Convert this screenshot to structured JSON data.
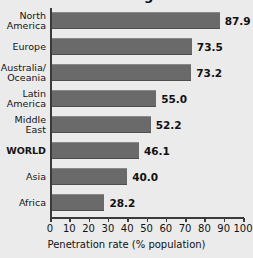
{
  "chart_data": {
    "type": "bar",
    "orientation": "horizontal",
    "title": "World Region",
    "xlabel": "Penetration rate (% population)",
    "ylabel": "",
    "categories": [
      "North America",
      "Europe",
      "Australia/ Oceania",
      "Latin America",
      "Middle East",
      "WORLD",
      "Asia",
      "Africa"
    ],
    "category_lines": [
      [
        "North",
        "America"
      ],
      [
        "Europe"
      ],
      [
        "Australia/",
        "Oceania"
      ],
      [
        "Latin",
        "America"
      ],
      [
        "Middle",
        "East"
      ],
      [
        "WORLD"
      ],
      [
        "Asia"
      ],
      [
        "Africa"
      ]
    ],
    "values": [
      87.9,
      73.5,
      73.2,
      55.0,
      52.2,
      46.1,
      40.0,
      28.2
    ],
    "value_labels": [
      "87.9",
      "73.5",
      "73.2",
      "55.0",
      "52.2",
      "46.1",
      "40.0",
      "28.2"
    ],
    "xlim": [
      0,
      100
    ],
    "xticks": [
      0,
      10,
      20,
      30,
      40,
      50,
      60,
      70,
      80,
      90,
      100
    ],
    "xtick_labels": [
      "0",
      "10",
      "20",
      "30",
      "40",
      "50",
      "60",
      "70",
      "80",
      "90",
      "100"
    ],
    "grid": false,
    "legend": null,
    "emphasized_category": "WORLD",
    "bar_color": "#6a6a6a",
    "background_color": "#ebebeb",
    "axis_color": "#3a3a3a",
    "text_color": "#111111"
  }
}
